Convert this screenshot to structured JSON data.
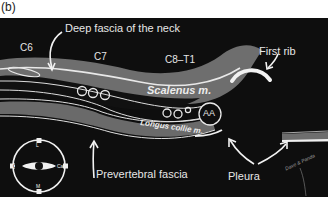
{
  "panel": {
    "label": "(b)"
  },
  "labels": {
    "c6": "C6",
    "c7": "C7",
    "c8_t1": "C8–T1",
    "deep_fascia": "Deep fascia of the neck",
    "first_rib": "First rib",
    "scalenus": "Scalenus m.",
    "longus_colli": "Longus collie m.",
    "aa": "AA",
    "prevertebral_fascia": "Prevertebral fascia",
    "pleura": "Pleura",
    "signature": "Dave & Panda"
  },
  "orientation": {
    "top": "L",
    "bottom": "M",
    "left": "Cr",
    "right": "Ca"
  },
  "colors": {
    "background": "#0e0e0e",
    "muscle_gray": "#6e6e6e",
    "fascia_line": "#e8e8e8",
    "text": "#e6e6e6"
  }
}
